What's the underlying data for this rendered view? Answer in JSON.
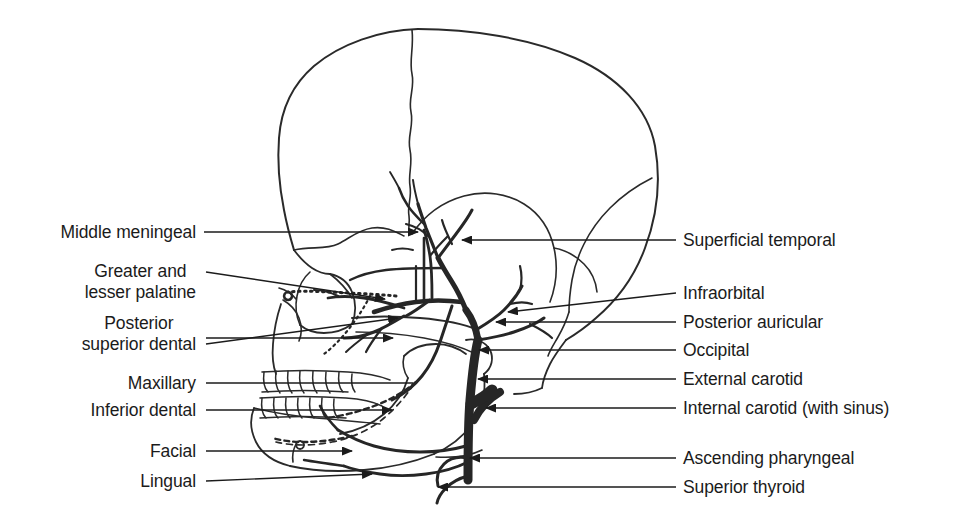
{
  "figure": {
    "kind": "anatomical-line-drawing",
    "background_color": "#ffffff",
    "ink_color": "#1b1b1b",
    "vessel_color": "#2b2b2b"
  },
  "labels_left": [
    {
      "id": "middle-meningeal",
      "text": "Middle meningeal",
      "lines": [
        "Middle meningeal"
      ],
      "x": 196,
      "y": 232
    },
    {
      "id": "greater-lesser-palatine",
      "text": "Greater and lesser palatine",
      "lines": [
        "Greater and",
        "lesser palatine"
      ],
      "x": 196,
      "y": 282
    },
    {
      "id": "posterior-superior-dental",
      "text": "Posterior superior dental",
      "lines": [
        "Posterior",
        "superior dental"
      ],
      "x": 196,
      "y": 334
    },
    {
      "id": "maxillary",
      "text": "Maxillary",
      "lines": [
        "Maxillary"
      ],
      "x": 196,
      "y": 383
    },
    {
      "id": "inferior-dental",
      "text": "Inferior dental",
      "lines": [
        "Inferior dental"
      ],
      "x": 196,
      "y": 410
    },
    {
      "id": "facial",
      "text": "Facial",
      "lines": [
        "Facial"
      ],
      "x": 196,
      "y": 451
    },
    {
      "id": "lingual",
      "text": "Lingual",
      "lines": [
        "Lingual"
      ],
      "x": 196,
      "y": 481
    }
  ],
  "labels_right": [
    {
      "id": "superficial-temporal",
      "text": "Superficial temporal",
      "x": 683,
      "y": 240
    },
    {
      "id": "infraorbital",
      "text": "Infraorbital",
      "x": 683,
      "y": 293
    },
    {
      "id": "posterior-auricular",
      "text": "Posterior auricular",
      "x": 683,
      "y": 322
    },
    {
      "id": "occipital",
      "text": "Occipital",
      "x": 683,
      "y": 350
    },
    {
      "id": "external-carotid",
      "text": "External carotid",
      "x": 683,
      "y": 379
    },
    {
      "id": "internal-carotid",
      "text": "Internal carotid (with sinus)",
      "x": 683,
      "y": 408
    },
    {
      "id": "ascending-pharyngeal",
      "text": "Ascending pharyngeal",
      "x": 683,
      "y": 458
    },
    {
      "id": "superior-thyroid",
      "text": "Superior thyroid",
      "x": 683,
      "y": 487
    }
  ],
  "leaders_left": [
    {
      "id": "leader-middle-meningeal",
      "d": "M204,232 L418,232",
      "arrow": "right",
      "tip": [
        418,
        232
      ]
    },
    {
      "id": "leader-greater-lesser-palatine",
      "d": "M206,272 L385,299",
      "arrow": "right",
      "tip": [
        385,
        299
      ]
    },
    {
      "id": "leader-posterior-superior-dental",
      "d": "M206,338 L392,338 L393,338",
      "arrow": "right",
      "tip": [
        392,
        338
      ]
    },
    {
      "id": "leader-maxillary-diag",
      "d": "M206,344 L398,318",
      "arrow": "right",
      "tip": [
        398,
        318
      ]
    },
    {
      "id": "leader-maxillary",
      "d": "M206,383 L413,383",
      "arrow": "none",
      "tip": [
        413,
        383
      ]
    },
    {
      "id": "leader-inferior-dental",
      "d": "M206,410 L392,410",
      "arrow": "right",
      "tip": [
        392,
        410
      ]
    },
    {
      "id": "leader-facial",
      "d": "M206,451 L352,451",
      "arrow": "right",
      "tip": [
        352,
        451
      ]
    },
    {
      "id": "leader-lingual",
      "d": "M206,481 L372,474",
      "arrow": "right",
      "tip": [
        372,
        474
      ]
    }
  ],
  "leaders_right": [
    {
      "id": "leader-superficial-temporal",
      "d": "M676,240 L462,240",
      "arrow": "left",
      "tip": [
        462,
        240
      ]
    },
    {
      "id": "leader-infraorbital",
      "d": "M676,293 L508,312",
      "arrow": "left",
      "tip": [
        508,
        312
      ]
    },
    {
      "id": "leader-posterior-auricular",
      "d": "M676,322 L496,322",
      "arrow": "left",
      "tip": [
        496,
        322
      ]
    },
    {
      "id": "leader-occipital",
      "d": "M676,350 L479,350",
      "arrow": "left",
      "tip": [
        479,
        350
      ]
    },
    {
      "id": "leader-external-carotid",
      "d": "M676,379 L478,379",
      "arrow": "left",
      "tip": [
        478,
        379
      ]
    },
    {
      "id": "leader-internal-carotid",
      "d": "M676,408 L486,408",
      "arrow": "left",
      "tip": [
        486,
        408
      ]
    },
    {
      "id": "leader-ascending-pharyngeal",
      "d": "M676,458 L470,458",
      "arrow": "left",
      "tip": [
        470,
        458
      ]
    },
    {
      "id": "leader-superior-thyroid",
      "d": "M676,487 L438,487",
      "arrow": "left",
      "tip": [
        438,
        487
      ]
    }
  ],
  "structures": {
    "cranium": "calvaria outline with coronal and lambdoid sutures",
    "orbit": "orbital rim and nasal aperture",
    "zygomatic_arch": "zygomatic arch crossing the temporal fossa",
    "maxilla_teeth": "upper dental arcade",
    "mandible_teeth": "lower dental arcade",
    "mandible": "mandible body, ramus, angle and condyle",
    "carotid_trunk": "thick common/external carotid trunk ascending in the neck"
  }
}
